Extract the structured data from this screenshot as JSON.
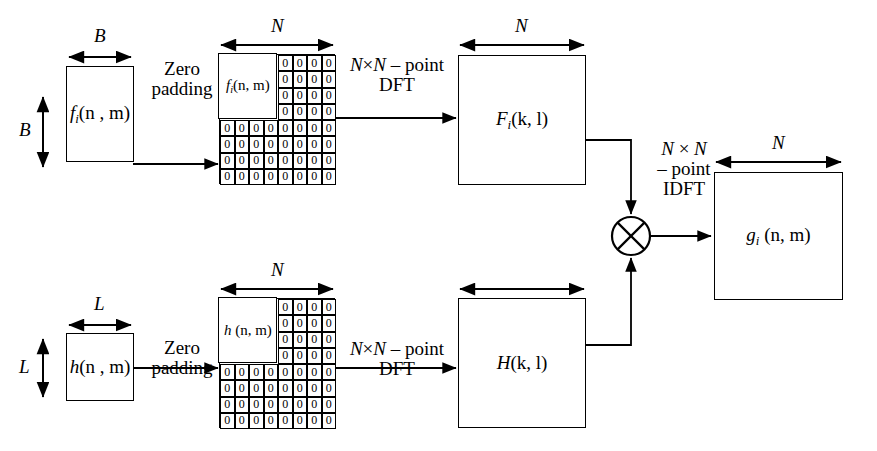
{
  "diagram": {
    "stroke_color": "#000000",
    "background_color": "#ffffff"
  },
  "top_branch": {
    "input_box": {
      "label_main": "f",
      "label_sub": "i",
      "label_args": "(n , m)",
      "width_dim": "B",
      "height_dim": "B"
    },
    "padding_label": {
      "line1": "Zero",
      "line2": "padding"
    },
    "padded_grid": {
      "dim_label": "N",
      "signal_label_main": "f",
      "signal_label_sub": "i",
      "signal_label_args": "(n, m)",
      "zero_value": "0",
      "cols": 8,
      "rows": 8,
      "signal_cols": 4,
      "signal_rows": 4
    },
    "dft_label": {
      "line1_a": "N",
      "line1_x": "×",
      "line1_b": "N",
      "line1_c": " – point",
      "line2": "DFT"
    },
    "output_box": {
      "label_main": "F",
      "label_sub": "i",
      "label_args": "(k, l)",
      "dim_label": "N"
    }
  },
  "bottom_branch": {
    "input_box": {
      "label_main": "h",
      "label_args": "(n , m)",
      "width_dim": "L",
      "height_dim": "L"
    },
    "padding_label": {
      "line1": "Zero",
      "line2": "padding"
    },
    "padded_grid": {
      "dim_label": "N",
      "signal_label_main": "h",
      "signal_label_args": " (n, m)",
      "zero_value": "0",
      "cols": 8,
      "rows": 8,
      "signal_cols": 4,
      "signal_rows": 4
    },
    "dft_label": {
      "line1_a": "N",
      "line1_x": "×",
      "line1_b": "N",
      "line1_c": " – point",
      "line2": "DFT"
    },
    "output_box": {
      "label_main": "H",
      "label_args": "(k, l)"
    }
  },
  "combiner": {
    "operator_name": "multiply",
    "operator_glyph": "⊗",
    "idft_label": {
      "line1_a": "N",
      "line1_x": " × ",
      "line1_b": "N",
      "line2": "– point",
      "line3": "IDFT"
    }
  },
  "output": {
    "box": {
      "label_main": "g",
      "label_sub": "i",
      "label_args": " (n, m)",
      "dim_label": "N"
    }
  }
}
